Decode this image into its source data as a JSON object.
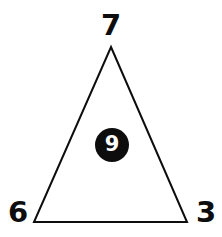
{
  "figure": {
    "canvas": {
      "width": 222,
      "height": 237,
      "background_color": "#ffffff"
    },
    "shape": {
      "name": "triangle",
      "type": "polygon",
      "stroke_color": "#0d0d0d",
      "fill_color": "none",
      "stroke_width": 2,
      "points": "111,47 187,222 34,222",
      "vertices": [
        {
          "id": "apex",
          "x": 111,
          "y": 47
        },
        {
          "id": "bottom-right",
          "x": 187,
          "y": 222
        },
        {
          "id": "bottom-left",
          "x": 34,
          "y": 222
        }
      ]
    },
    "vertex_labels": [
      {
        "id": "top",
        "text": "7",
        "color": "#0d0d0d"
      },
      {
        "id": "bottom-left",
        "text": "6",
        "color": "#0d0d0d"
      },
      {
        "id": "bottom-right",
        "text": "3",
        "color": "#0d0d0d"
      }
    ],
    "interior_token": {
      "text": "9",
      "shape": "circle",
      "fill_color": "#0d0d0d",
      "text_color": "#ffffff"
    }
  }
}
